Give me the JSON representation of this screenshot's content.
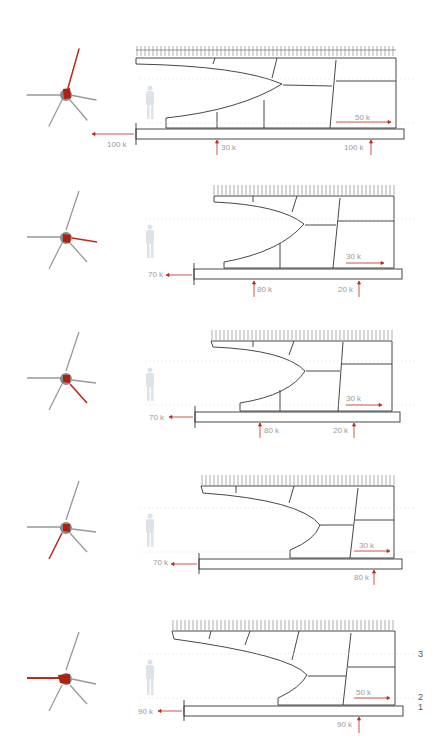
{
  "colors": {
    "accent": "#c0281c",
    "line": "#333333",
    "grey": "#8a8a8a",
    "label": "#9a9a9a"
  },
  "panels": [
    {
      "id": 1,
      "highlighted_branch": "north",
      "labels": {
        "left_force": "100 k",
        "mid_reaction": "30 k",
        "right_reaction": "100 k",
        "inner_force": "50 k"
      }
    },
    {
      "id": 2,
      "highlighted_branch": "east",
      "labels": {
        "left_force": "70 k",
        "mid_reaction": "80 k",
        "right_reaction": "20 k",
        "inner_force": "30 k"
      }
    },
    {
      "id": 3,
      "highlighted_branch": "southeast",
      "labels": {
        "left_force": "70 k",
        "mid_reaction": "80 k",
        "right_reaction": "20 k",
        "inner_force": "30 k"
      }
    },
    {
      "id": 4,
      "highlighted_branch": "southwest",
      "labels": {
        "left_force": "70 k",
        "right_reaction": "80 k",
        "inner_force": "30 k"
      }
    },
    {
      "id": 5,
      "highlighted_branch": "west",
      "labels": {
        "left_force": "90 k",
        "right_reaction": "90 k",
        "inner_force": "50 k"
      },
      "levels": [
        "3",
        "2",
        "1"
      ]
    }
  ]
}
